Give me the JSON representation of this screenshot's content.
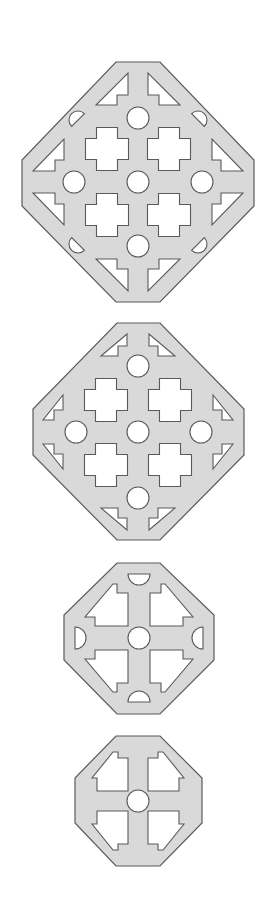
{
  "diagram": {
    "title": "",
    "colors": {
      "background": "#ffffff",
      "tile_fill": "#d9d9d9",
      "outline": "#5a5a5a",
      "hole_fill": "#ffffff"
    },
    "tiles": [
      {
        "name": "large-tile-with-lens-holes",
        "outline": [
          [
            116,
            62
          ],
          [
            160,
            62
          ],
          [
            254,
            160
          ],
          [
            254,
            206
          ],
          [
            160,
            302
          ],
          [
            116,
            302
          ],
          [
            22,
            206
          ],
          [
            22,
            160
          ]
        ],
        "circles": [
          [
            138,
            118,
            11
          ],
          [
            138,
            182,
            11
          ],
          [
            138,
            246,
            11
          ],
          [
            74,
            182,
            11
          ],
          [
            202,
            182,
            11
          ]
        ],
        "crosses": [
          [
            107,
            149,
            43,
            21
          ],
          [
            169,
            149,
            43,
            21
          ],
          [
            107,
            215,
            43,
            21
          ],
          [
            169,
            215,
            43,
            21
          ]
        ],
        "polys": [
          [
            [
              128,
              73
            ],
            [
              128,
              95
            ],
            [
              117,
              95
            ],
            [
              117,
              105
            ],
            [
              96,
              105
            ]
          ],
          [
            [
              148,
              73
            ],
            [
              148,
              95
            ],
            [
              159,
              95
            ],
            [
              159,
              105
            ],
            [
              180,
              105
            ]
          ],
          [
            [
              128,
              291
            ],
            [
              128,
              269
            ],
            [
              117,
              269
            ],
            [
              117,
              259
            ],
            [
              96,
              259
            ]
          ],
          [
            [
              148,
              291
            ],
            [
              148,
              269
            ],
            [
              159,
              269
            ],
            [
              159,
              259
            ],
            [
              180,
              259
            ]
          ],
          [
            [
              64,
              139
            ],
            [
              64,
              160
            ],
            [
              55,
              160
            ],
            [
              55,
              171
            ],
            [
              33,
              171
            ]
          ],
          [
            [
              212,
              139
            ],
            [
              212,
              160
            ],
            [
              221,
              160
            ],
            [
              221,
              171
            ],
            [
              243,
              171
            ]
          ],
          [
            [
              64,
              225
            ],
            [
              64,
              204
            ],
            [
              55,
              204
            ],
            [
              55,
              193
            ],
            [
              33,
              193
            ]
          ],
          [
            [
              212,
              225
            ],
            [
              212,
              204
            ],
            [
              221,
              204
            ],
            [
              221,
              193
            ],
            [
              243,
              193
            ]
          ]
        ],
        "lenses": [
          [
            78,
            120,
            9,
            -45
          ],
          [
            198,
            120,
            9,
            45
          ],
          [
            78,
            244,
            9,
            -135
          ],
          [
            198,
            244,
            9,
            135
          ]
        ]
      },
      {
        "name": "medium-tile",
        "outline": [
          [
            117,
            323
          ],
          [
            160,
            323
          ],
          [
            244,
            409
          ],
          [
            244,
            455
          ],
          [
            160,
            540
          ],
          [
            117,
            540
          ],
          [
            33,
            455
          ],
          [
            33,
            409
          ]
        ],
        "circles": [
          [
            138,
            366,
            11
          ],
          [
            138,
            432,
            11
          ],
          [
            138,
            498,
            11
          ],
          [
            76,
            432,
            11
          ],
          [
            201,
            432,
            11
          ]
        ],
        "crosses": [
          [
            106,
            400,
            43,
            21
          ],
          [
            170,
            400,
            43,
            21
          ],
          [
            106,
            465,
            43,
            21
          ],
          [
            170,
            465,
            43,
            21
          ]
        ],
        "polys": [
          [
            [
              127,
              334
            ],
            [
              127,
              346
            ],
            [
              118,
              346
            ],
            [
              118,
              356
            ],
            [
              101,
              356
            ]
          ],
          [
            [
              149,
              334
            ],
            [
              149,
              346
            ],
            [
              158,
              346
            ],
            [
              158,
              356
            ],
            [
              175,
              356
            ]
          ],
          [
            [
              127,
              530
            ],
            [
              127,
              518
            ],
            [
              118,
              518
            ],
            [
              118,
              508
            ],
            [
              101,
              508
            ]
          ],
          [
            [
              149,
              530
            ],
            [
              149,
              518
            ],
            [
              158,
              518
            ],
            [
              158,
              508
            ],
            [
              175,
              508
            ]
          ],
          [
            [
              63,
              395
            ],
            [
              63,
              410
            ],
            [
              54,
              410
            ],
            [
              54,
              420
            ],
            [
              43,
              420
            ]
          ],
          [
            [
              213,
              395
            ],
            [
              213,
              410
            ],
            [
              222,
              410
            ],
            [
              222,
              420
            ],
            [
              233,
              420
            ]
          ],
          [
            [
              63,
              469
            ],
            [
              63,
              454
            ],
            [
              54,
              454
            ],
            [
              54,
              444
            ],
            [
              43,
              444
            ]
          ],
          [
            [
              213,
              469
            ],
            [
              213,
              454
            ],
            [
              222,
              454
            ],
            [
              222,
              444
            ],
            [
              233,
              444
            ]
          ]
        ],
        "lenses": []
      },
      {
        "name": "small-octagon-tile",
        "outline": [
          [
            117,
            563
          ],
          [
            160,
            563
          ],
          [
            214,
            615
          ],
          [
            214,
            660
          ],
          [
            160,
            714
          ],
          [
            117,
            714
          ],
          [
            64,
            660
          ],
          [
            64,
            615
          ]
        ],
        "circles": [
          [
            139,
            638,
            11
          ]
        ],
        "crosses": [],
        "polys": [
          [
            [
              113,
              584
            ],
            [
              117,
              584
            ],
            [
              117,
              593
            ],
            [
              128,
              593
            ],
            [
              128,
              626
            ],
            [
              95,
              626
            ],
            [
              95,
              617
            ],
            [
              85,
              617
            ]
          ],
          [
            [
              165,
              584
            ],
            [
              161,
              584
            ],
            [
              161,
              593
            ],
            [
              150,
              593
            ],
            [
              150,
              626
            ],
            [
              183,
              626
            ],
            [
              183,
              617
            ],
            [
              193,
              617
            ]
          ],
          [
            [
              113,
              692
            ],
            [
              117,
              692
            ],
            [
              117,
              683
            ],
            [
              128,
              683
            ],
            [
              128,
              650
            ],
            [
              95,
              650
            ],
            [
              95,
              659
            ],
            [
              85,
              659
            ]
          ],
          [
            [
              165,
              692
            ],
            [
              161,
              692
            ],
            [
              161,
              683
            ],
            [
              150,
              683
            ],
            [
              150,
              650
            ],
            [
              183,
              650
            ],
            [
              183,
              659
            ],
            [
              193,
              659
            ]
          ]
        ],
        "halfdiscs": [
          [
            139,
            574,
            11,
            0
          ],
          [
            139,
            702,
            11,
            180
          ],
          [
            75,
            638,
            11,
            -90
          ],
          [
            203,
            638,
            11,
            90
          ]
        ],
        "lenses": []
      },
      {
        "name": "smallest-octagon-tile",
        "outline": [
          [
            116,
            736
          ],
          [
            160,
            736
          ],
          [
            202,
            778
          ],
          [
            202,
            823
          ],
          [
            160,
            866
          ],
          [
            116,
            866
          ],
          [
            75,
            823
          ],
          [
            75,
            778
          ]
        ],
        "circles": [
          [
            138,
            801,
            11
          ]
        ],
        "crosses": [],
        "polys": [
          [
            [
              113,
              752
            ],
            [
              118,
              752
            ],
            [
              118,
              758
            ],
            [
              128,
              758
            ],
            [
              128,
              791
            ],
            [
              97,
              791
            ],
            [
              97,
              778
            ],
            [
              92,
              778
            ]
          ],
          [
            [
              163,
              752
            ],
            [
              158,
              752
            ],
            [
              158,
              758
            ],
            [
              148,
              758
            ],
            [
              148,
              791
            ],
            [
              179,
              791
            ],
            [
              179,
              778
            ],
            [
              184,
              778
            ]
          ],
          [
            [
              113,
              850
            ],
            [
              118,
              850
            ],
            [
              118,
              844
            ],
            [
              128,
              844
            ],
            [
              128,
              811
            ],
            [
              97,
              811
            ],
            [
              97,
              824
            ],
            [
              92,
              824
            ]
          ],
          [
            [
              163,
              850
            ],
            [
              158,
              850
            ],
            [
              158,
              844
            ],
            [
              148,
              844
            ],
            [
              148,
              811
            ],
            [
              179,
              811
            ],
            [
              179,
              824
            ],
            [
              184,
              824
            ]
          ]
        ],
        "lenses": []
      }
    ]
  }
}
